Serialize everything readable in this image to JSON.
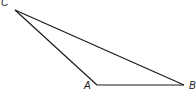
{
  "diagram": {
    "type": "triangle",
    "stroke_color": "#1a1a1a",
    "vertices": {
      "A": {
        "label": "A",
        "x": 97,
        "y": 85
      },
      "B": {
        "label": "B",
        "x": 184,
        "y": 85
      },
      "C": {
        "label": "C",
        "x": 15,
        "y": 10
      }
    },
    "edges": [
      [
        "C",
        "B"
      ],
      [
        "C",
        "A"
      ],
      [
        "A",
        "B"
      ]
    ]
  }
}
